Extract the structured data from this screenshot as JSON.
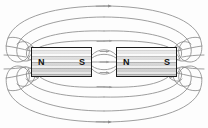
{
  "diagram": {
    "background_color": "#fdfdfd",
    "line_color": "#8c8c8c",
    "arrow_color": "#8c8c8c",
    "magnet_border_color": "#1c1c1c",
    "magnet_fill_color": "#d8d8d8"
  },
  "magnets": [
    {
      "id": "magnet-left",
      "left_pole_label": "N",
      "right_pole_label": "S",
      "x": 31,
      "y": 47,
      "width": 61,
      "height": 30
    },
    {
      "id": "magnet-right",
      "left_pole_label": "N",
      "right_pole_label": "S",
      "x": 116,
      "y": 47,
      "width": 61,
      "height": 30
    }
  ],
  "field_lines": {
    "count_upper": 4,
    "count_lower": 4,
    "direction": "S-to-N externally, left-to-right along top and bottom",
    "arrow_markers": [
      {
        "name": "top-outer-arrow",
        "x": 104,
        "y": 7,
        "direction": "right"
      },
      {
        "name": "bottom-outer-arrow",
        "x": 104,
        "y": 121,
        "direction": "right"
      },
      {
        "name": "center-upper-arrow",
        "x": 104,
        "y": 40,
        "direction": "right"
      },
      {
        "name": "center-lower-arrow",
        "x": 104,
        "y": 88,
        "direction": "right"
      },
      {
        "name": "gap-arrow-upper",
        "x": 104,
        "y": 55,
        "direction": "right"
      },
      {
        "name": "gap-arrow-lower",
        "x": 104,
        "y": 69,
        "direction": "right"
      }
    ]
  }
}
